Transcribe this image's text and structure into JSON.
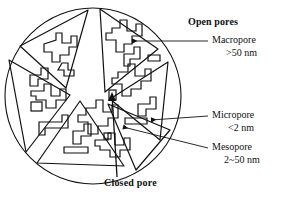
{
  "figure": {
    "type": "schematic-diagram",
    "background_color": "#ffffff",
    "line_color": "#111111"
  },
  "labels": {
    "open_pores": "Open pores",
    "macropore": "Macropore",
    "macropore_size": ">50 nm",
    "micropore": "Micropore",
    "micropore_size": "<2 nm",
    "mesopore": "Mesopore",
    "mesopore_size": "2~50 nm",
    "closed_pore": "Closed  pore"
  },
  "annotations": [
    {
      "name": "macropore",
      "text": "Macropore",
      "size_text": ">50 nm",
      "group": "Open pores",
      "leader": {
        "from_x": 205,
        "from_y": 41,
        "to_x": 131,
        "to_y": 41
      },
      "arrowhead": "left"
    },
    {
      "name": "micropore",
      "text": "Micropore",
      "size_text": "<2 nm",
      "group": "Open pores",
      "leader": {
        "from_x": 205,
        "from_y": 116,
        "to_x": 150,
        "to_y": 120
      },
      "arrowhead": "left"
    },
    {
      "name": "mesopore",
      "text": "Mesopore",
      "size_text": "2~50 nm",
      "group": "Open pores",
      "leader": {
        "from_x": 205,
        "from_y": 148,
        "to_x": 122,
        "to_y": 127
      },
      "arrowhead": "left"
    },
    {
      "name": "closed-pore",
      "text": "Closed  pore",
      "size_text": "",
      "group": "Closed",
      "leader": {
        "from_x": 116,
        "from_y": 176,
        "to_x": 112,
        "to_y": 95
      },
      "arrowhead": "up"
    }
  ],
  "particle": {
    "center_x": 93,
    "center_y": 96,
    "radius": 88,
    "wedge_count": 6,
    "closed_pore_marks": [
      {
        "x": 112,
        "y": 95,
        "w": 6,
        "h": 9
      },
      {
        "x": 35,
        "y": 105,
        "w": 10,
        "h": 8
      }
    ]
  }
}
